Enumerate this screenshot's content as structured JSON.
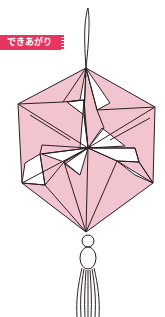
{
  "header": {
    "top_text_partial": "",
    "badge_label": "できあがり"
  },
  "illustration": {
    "subject": "origami hexagonal ornament with pinwheel pattern, hanging loop and tassel",
    "colors": {
      "fill": "#f2c4cf",
      "stroke": "#2a1f22",
      "badge": "#e8355f"
    }
  }
}
